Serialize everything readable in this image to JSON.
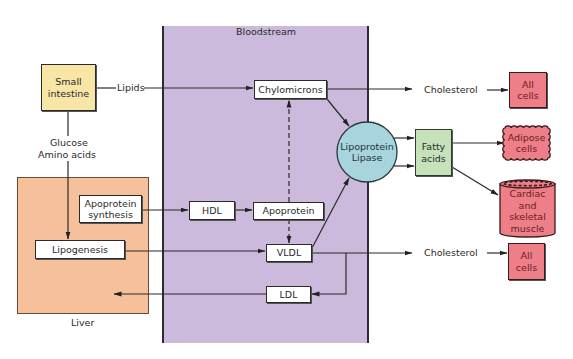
{
  "diagram": {
    "regions": {
      "bloodstream": {
        "label": "Bloodstream",
        "color": "#cbbadb"
      },
      "liver": {
        "label": "Liver",
        "color": "#f6c09a"
      }
    },
    "nodes": {
      "small_intestine": {
        "line1": "Small",
        "line2": "intestine",
        "color": "#f8e6a6"
      },
      "apoprotein_synthesis": {
        "line1": "Apoprotein",
        "line2": "synthesis"
      },
      "lipogenesis": {
        "label": "Lipogenesis"
      },
      "hdl": {
        "label": "HDL"
      },
      "apoprotein": {
        "label": "Apoprotein"
      },
      "chylomicrons": {
        "label": "Chylomicrons"
      },
      "vldl": {
        "label": "VLDL"
      },
      "ldl": {
        "label": "LDL"
      },
      "lipoprotein_lipase": {
        "line1": "Lipoprotein",
        "line2": "Lipase",
        "color": "#a8d5dd"
      },
      "fatty_acids": {
        "line1": "Fatty",
        "line2": "acids",
        "color": "#c5e2bb"
      },
      "all_cells_top": {
        "line1": "All",
        "line2": "cells",
        "color": "#ee7e87"
      },
      "adipose_cells": {
        "line1": "Adipose",
        "line2": "cells",
        "color": "#ee7e87"
      },
      "cardiac_skeletal_muscle": {
        "line1": "Cardiac",
        "line2": "and",
        "line3": "skeletal",
        "line4": "muscle",
        "color": "#ee7e87"
      },
      "all_cells_bottom": {
        "line1": "All",
        "line2": "cells",
        "color": "#ee7e87"
      }
    },
    "edge_labels": {
      "lipids": "Lipids",
      "glucose": "Glucose",
      "amino_acids": "Amino acids",
      "cholesterol_top": "Cholesterol",
      "cholesterol_bottom": "Cholesterol"
    },
    "edges": [
      {
        "from": "small_intestine",
        "to": "chylomicrons",
        "label": "Lipids",
        "style": "solid"
      },
      {
        "from": "small_intestine",
        "to": "lipogenesis",
        "label": "Glucose / Amino acids",
        "style": "solid"
      },
      {
        "from": "apoprotein_synthesis",
        "to": "hdl",
        "style": "solid"
      },
      {
        "from": "hdl",
        "to": "apoprotein",
        "style": "solid"
      },
      {
        "from": "lipogenesis",
        "to": "vldl",
        "style": "solid"
      },
      {
        "from": "apoprotein",
        "to": "chylomicrons",
        "style": "dashed"
      },
      {
        "from": "apoprotein",
        "to": "vldl",
        "style": "dashed"
      },
      {
        "from": "chylomicrons",
        "to": "lipoprotein_lipase",
        "style": "solid"
      },
      {
        "from": "vldl",
        "to": "lipoprotein_lipase",
        "style": "solid"
      },
      {
        "from": "chylomicrons",
        "to": "all_cells_top",
        "label": "Cholesterol",
        "style": "solid"
      },
      {
        "from": "vldl",
        "to": "all_cells_bottom",
        "label": "Cholesterol",
        "style": "solid"
      },
      {
        "from": "vldl",
        "to": "ldl",
        "style": "solid"
      },
      {
        "from": "ldl",
        "to": "liver",
        "style": "solid"
      },
      {
        "from": "lipoprotein_lipase",
        "to": "fatty_acids",
        "style": "solid"
      },
      {
        "from": "fatty_acids",
        "to": "adipose_cells",
        "style": "solid"
      },
      {
        "from": "fatty_acids",
        "to": "cardiac_skeletal_muscle",
        "style": "solid"
      }
    ]
  }
}
